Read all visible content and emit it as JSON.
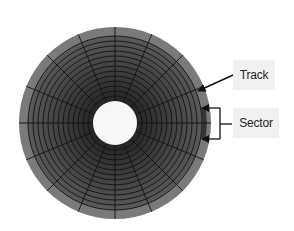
{
  "diagram": {
    "disk": {
      "center": [
        115,
        123
      ],
      "outer_radius": 96,
      "band_width": 9,
      "hole_radius": 22,
      "track_count": 13,
      "sector_count": 16,
      "colors": {
        "outer_band": "#7a7a7a",
        "track_outer": "#555555",
        "track_inner": "#2e2e2e",
        "grid_line": "#111111",
        "hole": "#f7f7f7",
        "highlight_sector": "#2a2a2a"
      }
    },
    "labels": {
      "track": "Track",
      "sector": "Sector"
    },
    "arrow_color": "#111111"
  }
}
